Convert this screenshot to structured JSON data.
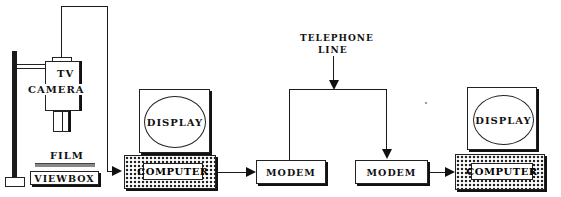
{
  "diagram": {
    "nodes": {
      "tv_camera": {
        "label_line1": "TV",
        "label_line2": "CAMERA"
      },
      "film": {
        "label": "FILM"
      },
      "viewbox": {
        "label": "VIEWBOX"
      },
      "display_left": {
        "label": "DISPLAY"
      },
      "computer_left": {
        "label": "COMPUTER"
      },
      "modem_left": {
        "label": "MODEM"
      },
      "telephone_line": {
        "label_line1": "TELEPHONE",
        "label_line2": "LINE"
      },
      "modem_right": {
        "label": "MODEM"
      },
      "display_right": {
        "label": "DISPLAY"
      },
      "computer_right": {
        "label": "COMPUTER"
      }
    },
    "edges": [
      {
        "from": "tv_camera",
        "to": "computer_left"
      },
      {
        "from": "computer_left",
        "to": "modem_left"
      },
      {
        "from": "modem_left",
        "to": "telephone_line"
      },
      {
        "from": "telephone_line",
        "to": "modem_right"
      },
      {
        "from": "modem_right",
        "to": "computer_right"
      }
    ]
  }
}
